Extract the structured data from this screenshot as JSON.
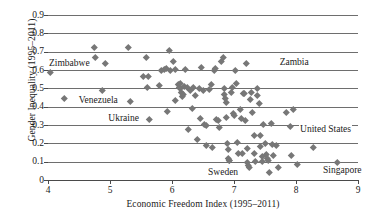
{
  "chart_data": {
    "type": "scatter",
    "title": "",
    "xlabel": "Economic Freedom Index (1995–2011)",
    "ylabel": "Gender Inequality (1995–2011)",
    "xlim": [
      4,
      9
    ],
    "ylim": [
      0,
      0.9
    ],
    "xticks": [
      "4",
      "5",
      "6",
      "7",
      "8",
      "9"
    ],
    "yticks": [
      "0",
      "0.1",
      "0.2",
      "0.3",
      "0.4",
      "0.5",
      "0.6",
      "0.7",
      "0.8",
      "0.9"
    ],
    "grid": "horizontal",
    "legend": "none",
    "marker": "diamond",
    "marker_color": "#777777",
    "gridline_color": "#6e6e6e",
    "annotations": [
      {
        "label": "Zimbabwe",
        "x": 4.62,
        "y": 0.625,
        "align": "right"
      },
      {
        "label": "Venezuela",
        "x": 4.48,
        "y": 0.425,
        "align": "left"
      },
      {
        "label": "Ukraine",
        "x": 5.45,
        "y": 0.325,
        "align": "right"
      },
      {
        "label": "Zambia",
        "x": 7.72,
        "y": 0.635,
        "align": "left"
      },
      {
        "label": "United States",
        "x": 8.05,
        "y": 0.265,
        "align": "left"
      },
      {
        "label": "Sweden",
        "x": 7.05,
        "y": 0.035,
        "align": "right"
      },
      {
        "label": "Singapore",
        "x": 8.42,
        "y": 0.042,
        "align": "left"
      }
    ],
    "points": [
      {
        "x": 4.03,
        "y": 0.59
      },
      {
        "x": 4.27,
        "y": 0.445
      },
      {
        "x": 4.75,
        "y": 0.722
      },
      {
        "x": 4.76,
        "y": 0.672
      },
      {
        "x": 4.88,
        "y": 0.492
      },
      {
        "x": 4.93,
        "y": 0.635
      },
      {
        "x": 5.3,
        "y": 0.722
      },
      {
        "x": 5.32,
        "y": 0.432
      },
      {
        "x": 5.54,
        "y": 0.566
      },
      {
        "x": 5.62,
        "y": 0.566
      },
      {
        "x": 5.58,
        "y": 0.668
      },
      {
        "x": 5.6,
        "y": 0.505
      },
      {
        "x": 5.63,
        "y": 0.33
      },
      {
        "x": 5.8,
        "y": 0.515
      },
      {
        "x": 5.83,
        "y": 0.6
      },
      {
        "x": 5.87,
        "y": 0.605
      },
      {
        "x": 5.9,
        "y": 0.61
      },
      {
        "x": 5.92,
        "y": 0.375
      },
      {
        "x": 5.96,
        "y": 0.71
      },
      {
        "x": 5.98,
        "y": 0.6
      },
      {
        "x": 6.02,
        "y": 0.648
      },
      {
        "x": 6.05,
        "y": 0.606
      },
      {
        "x": 6.06,
        "y": 0.436
      },
      {
        "x": 6.1,
        "y": 0.52
      },
      {
        "x": 6.12,
        "y": 0.508
      },
      {
        "x": 6.13,
        "y": 0.53
      },
      {
        "x": 6.14,
        "y": 0.5
      },
      {
        "x": 6.15,
        "y": 0.48
      },
      {
        "x": 6.17,
        "y": 0.455
      },
      {
        "x": 6.19,
        "y": 0.465
      },
      {
        "x": 6.2,
        "y": 0.51
      },
      {
        "x": 6.21,
        "y": 0.605
      },
      {
        "x": 6.25,
        "y": 0.505
      },
      {
        "x": 6.26,
        "y": 0.278
      },
      {
        "x": 6.3,
        "y": 0.49
      },
      {
        "x": 6.33,
        "y": 0.39
      },
      {
        "x": 6.35,
        "y": 0.505
      },
      {
        "x": 6.38,
        "y": 0.46
      },
      {
        "x": 6.4,
        "y": 0.222
      },
      {
        "x": 6.44,
        "y": 0.5
      },
      {
        "x": 6.46,
        "y": 0.335
      },
      {
        "x": 6.48,
        "y": 0.615
      },
      {
        "x": 6.5,
        "y": 0.49
      },
      {
        "x": 6.52,
        "y": 0.305
      },
      {
        "x": 6.55,
        "y": 0.297
      },
      {
        "x": 6.56,
        "y": 0.188
      },
      {
        "x": 6.6,
        "y": 0.495
      },
      {
        "x": 6.63,
        "y": 0.52
      },
      {
        "x": 6.65,
        "y": 0.176
      },
      {
        "x": 6.68,
        "y": 0.6
      },
      {
        "x": 6.7,
        "y": 0.612
      },
      {
        "x": 6.72,
        "y": 0.33
      },
      {
        "x": 6.74,
        "y": 0.325
      },
      {
        "x": 6.76,
        "y": 0.288
      },
      {
        "x": 6.8,
        "y": 0.648
      },
      {
        "x": 6.82,
        "y": 0.672
      },
      {
        "x": 6.84,
        "y": 0.5
      },
      {
        "x": 6.85,
        "y": 0.465
      },
      {
        "x": 6.86,
        "y": 0.445
      },
      {
        "x": 6.87,
        "y": 0.425
      },
      {
        "x": 6.88,
        "y": 0.34
      },
      {
        "x": 6.89,
        "y": 0.2
      },
      {
        "x": 6.9,
        "y": 0.168
      },
      {
        "x": 6.91,
        "y": 0.118
      },
      {
        "x": 6.92,
        "y": 0.108
      },
      {
        "x": 6.93,
        "y": 0.105
      },
      {
        "x": 6.95,
        "y": 0.478
      },
      {
        "x": 6.97,
        "y": 0.505
      },
      {
        "x": 6.99,
        "y": 0.362
      },
      {
        "x": 7.0,
        "y": 0.355
      },
      {
        "x": 7.02,
        "y": 0.6
      },
      {
        "x": 7.04,
        "y": 0.525
      },
      {
        "x": 7.05,
        "y": 0.205
      },
      {
        "x": 7.07,
        "y": 0.148
      },
      {
        "x": 7.1,
        "y": 0.385
      },
      {
        "x": 7.12,
        "y": 0.335
      },
      {
        "x": 7.13,
        "y": 0.148
      },
      {
        "x": 7.15,
        "y": 0.472
      },
      {
        "x": 7.17,
        "y": 0.475
      },
      {
        "x": 7.18,
        "y": 0.325
      },
      {
        "x": 7.2,
        "y": 0.635
      },
      {
        "x": 7.21,
        "y": 0.175
      },
      {
        "x": 7.22,
        "y": 0.098
      },
      {
        "x": 7.23,
        "y": 0.082
      },
      {
        "x": 7.24,
        "y": 0.072
      },
      {
        "x": 7.26,
        "y": 0.44
      },
      {
        "x": 7.28,
        "y": 0.478
      },
      {
        "x": 7.3,
        "y": 0.368
      },
      {
        "x": 7.32,
        "y": 0.244
      },
      {
        "x": 7.33,
        "y": 0.146
      },
      {
        "x": 7.35,
        "y": 0.103
      },
      {
        "x": 7.37,
        "y": 0.5
      },
      {
        "x": 7.38,
        "y": 0.46
      },
      {
        "x": 7.4,
        "y": 0.42
      },
      {
        "x": 7.42,
        "y": 0.242
      },
      {
        "x": 7.43,
        "y": 0.185
      },
      {
        "x": 7.45,
        "y": 0.132
      },
      {
        "x": 7.46,
        "y": 0.1
      },
      {
        "x": 7.48,
        "y": 0.302
      },
      {
        "x": 7.5,
        "y": 0.198
      },
      {
        "x": 7.52,
        "y": 0.14
      },
      {
        "x": 7.53,
        "y": 0.118
      },
      {
        "x": 7.55,
        "y": 0.105
      },
      {
        "x": 7.57,
        "y": 0.042
      },
      {
        "x": 7.6,
        "y": 0.312
      },
      {
        "x": 7.62,
        "y": 0.196
      },
      {
        "x": 7.64,
        "y": 0.135
      },
      {
        "x": 7.68,
        "y": 0.188
      },
      {
        "x": 7.72,
        "y": 0.068
      },
      {
        "x": 7.85,
        "y": 0.372
      },
      {
        "x": 7.9,
        "y": 0.295
      },
      {
        "x": 7.92,
        "y": 0.135
      },
      {
        "x": 7.96,
        "y": 0.388
      },
      {
        "x": 8.02,
        "y": 0.088
      },
      {
        "x": 8.28,
        "y": 0.178
      },
      {
        "x": 8.67,
        "y": 0.095
      }
    ]
  }
}
